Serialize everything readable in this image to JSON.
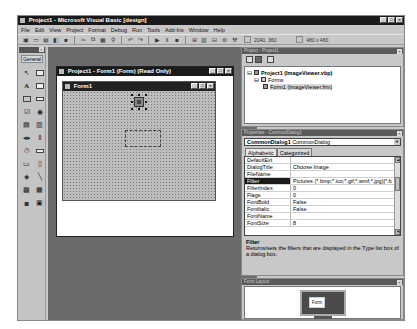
{
  "window": {
    "title": "Project1 - Microsoft Visual Basic [design]",
    "controls": [
      "_",
      "□",
      "×"
    ]
  },
  "menubar": [
    "File",
    "Edit",
    "View",
    "Project",
    "Format",
    "Debug",
    "Run",
    "Tools",
    "Add-Ins",
    "Window",
    "Help"
  ],
  "toolbar": {
    "icons": [
      "add-project-icon",
      "add-form-icon",
      "menu-editor-icon",
      "open-icon",
      "save-icon",
      "cut-icon",
      "copy-icon",
      "paste-icon",
      "find-icon",
      "undo-icon",
      "redo-icon",
      "run-icon",
      "break-icon",
      "end-icon",
      "project-explorer-icon",
      "properties-icon",
      "form-layout-icon",
      "object-browser-icon",
      "toolbox-icon"
    ],
    "position": "2040, 360",
    "size": "480 x 480"
  },
  "toolbox": {
    "tab_label": "General",
    "tools": [
      "pointer",
      "picturebox",
      "label",
      "textbox",
      "frame",
      "commandbutton",
      "checkbox",
      "optionbutton",
      "combobox",
      "listbox",
      "hscrollbar",
      "vscrollbar",
      "timer",
      "drivelistbox",
      "dirlistbox",
      "filelistbox",
      "shape",
      "line",
      "image",
      "data",
      "ole",
      "commondialog"
    ]
  },
  "designer": {
    "title": "Project1 - Form1 (Form)  (Read Only)",
    "form_title": "Form1"
  },
  "project_explorer": {
    "title": "Project - Project1",
    "root": "Project1 (ImageViewer.vbp)",
    "folder": "Forms",
    "item": "Form1 (ImageViewer.frm)"
  },
  "properties": {
    "title": "Properties - CommonDialog1",
    "object_name": "CommonDialog1",
    "object_type": "CommonDialog",
    "tabs": [
      "Alphabetic",
      "Categorized"
    ],
    "rows": [
      {
        "key": "DefaultExt",
        "value": ""
      },
      {
        "key": "DialogTitle",
        "value": "Choose Image"
      },
      {
        "key": "FileName",
        "value": ""
      },
      {
        "key": "Filter",
        "value": "Pictures (*.bmp;*.ico;*.gif;*.wmf;*.jpg)|*.b"
      },
      {
        "key": "FilterIndex",
        "value": "0"
      },
      {
        "key": "Flags",
        "value": "0"
      },
      {
        "key": "FontBold",
        "value": "False"
      },
      {
        "key": "FontItalic",
        "value": "False"
      },
      {
        "key": "FontName",
        "value": ""
      },
      {
        "key": "FontSize",
        "value": "8"
      }
    ],
    "selected_row": "Filter",
    "description_title": "Filter",
    "description_text": "Returns/sets the filters that are displayed in the Type list box of a dialog box."
  },
  "form_layout": {
    "title": "Form Layout",
    "mini_form_label": "Form"
  }
}
